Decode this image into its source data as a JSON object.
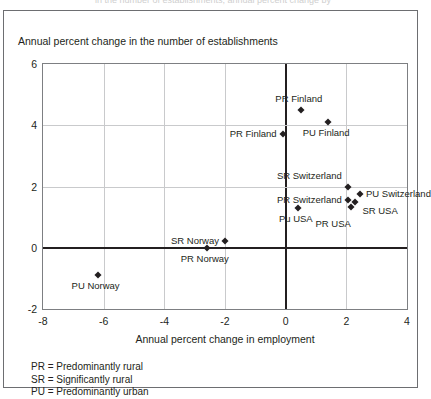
{
  "figure": {
    "caption": "in the number of establishments, annual percent change by"
  },
  "chart_data": {
    "type": "scatter",
    "title": "",
    "ylabel": "Annual percent change in the number of establishments",
    "xlabel": "Annual percent change in employment",
    "xlim": [
      -8,
      4
    ],
    "ylim": [
      -2,
      6
    ],
    "xticks": [
      -8,
      -6,
      -4,
      -2,
      0,
      2,
      4
    ],
    "yticks": [
      -2,
      0,
      2,
      4,
      6
    ],
    "xtick_labels": [
      "-8",
      "-6",
      "-4",
      "-2",
      "0",
      "2",
      "4"
    ],
    "ytick_labels": [
      "-2",
      "0",
      "2",
      "4",
      "6"
    ],
    "grid": true,
    "legend_position": "below-plot",
    "points": [
      {
        "label": "PR Finland",
        "x": 0.5,
        "y": 4.5,
        "label_pos": "above"
      },
      {
        "label": "PU Finland",
        "x": 1.4,
        "y": 4.1,
        "label_pos": "below"
      },
      {
        "label": "PR Finland",
        "x": -0.1,
        "y": 3.7,
        "label_pos": "left"
      },
      {
        "label": "SR Switzerland",
        "x": 2.05,
        "y": 2.0,
        "label_pos": "above-left"
      },
      {
        "label": "PU Switzerland",
        "x": 2.45,
        "y": 1.75,
        "label_pos": "right"
      },
      {
        "label": "PR Switzerland",
        "x": 2.05,
        "y": 1.55,
        "label_pos": "left"
      },
      {
        "label": "SR USA",
        "x": 2.3,
        "y": 1.48,
        "label_pos": "right-below"
      },
      {
        "label": "PR USA",
        "x": 2.15,
        "y": 1.32,
        "label_pos": "below-right"
      },
      {
        "label": "Pu USA",
        "x": 0.4,
        "y": 1.3,
        "label_pos": "below"
      },
      {
        "label": "SR Norway",
        "x": -2.0,
        "y": 0.22,
        "label_pos": "left"
      },
      {
        "label": "PR Norway",
        "x": -2.6,
        "y": 0.0,
        "label_pos": "below"
      },
      {
        "label": "PU Norway",
        "x": -6.2,
        "y": -0.9,
        "label_pos": "below"
      }
    ]
  },
  "legend": {
    "lines": [
      "PR = Predominantly rural",
      "SR = Significantly rural",
      "PU = Predominantly urban"
    ]
  },
  "colors": {
    "marker": "#231f20",
    "grid": "#c9cacc",
    "axis": "#231f20",
    "frame": "#6d6e71"
  }
}
